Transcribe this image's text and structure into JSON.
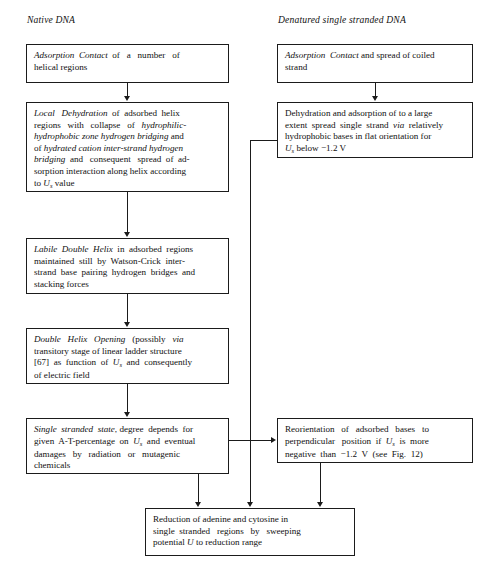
{
  "figure": {
    "type": "flowchart",
    "columns": [
      {
        "id": "native",
        "heading": "Native DNA"
      },
      {
        "id": "denatured",
        "heading": "Denatured single stranded DNA"
      }
    ]
  },
  "nodes": {
    "left1": {
      "id": "left1",
      "emphasis": "Adsorption Contact",
      "text_plain": "Adsorption Contact of a number of helical regions"
    },
    "left2": {
      "id": "left2",
      "emphasis": "Local Dehydration",
      "text_plain": "Local Dehydration of adsorbed helix regions with collapse of hydrophilic-hydrophobic zone hydrogen bridging and of hydrated cation inter-strand hydrogen bridging and consequent spread of adsorption interaction along helix according to Us value"
    },
    "left3": {
      "id": "left3",
      "emphasis": "Labile Double Helix",
      "text_plain": "Labile Double Helix in adsorbed regions maintained still by Watson-Crick inter-strand base pairing hydrogen bridges and stacking forces"
    },
    "left4": {
      "id": "left4",
      "emphasis": "Double Helix Opening",
      "text_plain": "Double Helix Opening (possibly via transitory stage of linear ladder structure [67] as function of Us and consequently of electric field"
    },
    "left5": {
      "id": "left5",
      "emphasis": "Single stranded state",
      "text_plain": "Single stranded state, degree depends for given A-T-percentage on Us and eventual damages by radiation or mutagenic chemicals"
    },
    "right1": {
      "id": "right1",
      "emphasis": "Adsorption Contact",
      "text_plain": "Adsorption Contact and spread of coiled strand"
    },
    "right2": {
      "id": "right2",
      "emphasis": "via",
      "text_plain": "Dehydration and adsorption of to a large extent spread single strand via relatively hydrophobic bases in flat orientation for Us below −1.2 V"
    },
    "right3": {
      "id": "right3",
      "emphasis": "",
      "text_plain": "Reorientation of adsorbed bases to perpendicular position if Us is more negative than −1.2 V (see Fig. 12)"
    },
    "bottom": {
      "id": "bottom",
      "emphasis": "U",
      "text_plain": "Reduction of adenine and cytosine in single stranded regions by sweeping potential U to reduction range"
    }
  },
  "symbols": {
    "Us": "Uₛ",
    "U": "U",
    "voltage_threshold": "−1.2 V",
    "reference": "[67]",
    "figure_reference": "Fig. 12"
  },
  "edges": [
    {
      "from": "left1",
      "to": "left2",
      "style": "straight-down"
    },
    {
      "from": "left2",
      "to": "left3",
      "style": "straight-down"
    },
    {
      "from": "left3",
      "to": "left4",
      "style": "straight-down"
    },
    {
      "from": "left4",
      "to": "left5",
      "style": "straight-down"
    },
    {
      "from": "left5",
      "to": "bottom",
      "style": "straight-down"
    },
    {
      "from": "left5",
      "to": "right3",
      "style": "elbow-right"
    },
    {
      "from": "right1",
      "to": "right2",
      "style": "straight-down"
    },
    {
      "from": "right2",
      "to": "bottom",
      "style": "elbow-left-down"
    },
    {
      "from": "right3",
      "to": "bottom",
      "style": "straight-down"
    }
  ],
  "colors": {
    "ink": "#1b1b1b",
    "background": "#ffffff",
    "text": "#101010"
  }
}
